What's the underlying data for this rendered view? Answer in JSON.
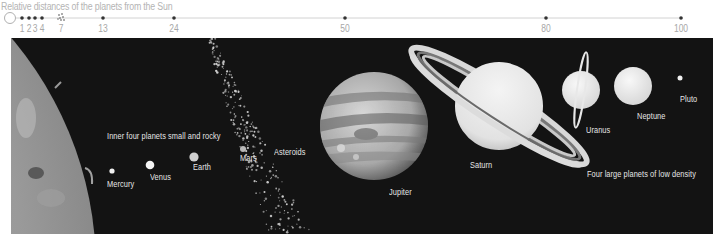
{
  "title": "Relative distances of the planets from the Sun",
  "scale": {
    "ticks": [
      {
        "value": "1",
        "x": 22
      },
      {
        "value": "2",
        "x": 29
      },
      {
        "value": "3",
        "x": 35
      },
      {
        "value": "4",
        "x": 42
      },
      {
        "value": "7",
        "x": 61
      },
      {
        "value": "13",
        "x": 103
      },
      {
        "value": "24",
        "x": 174
      },
      {
        "value": "50",
        "x": 345
      },
      {
        "value": "80",
        "x": 546
      },
      {
        "value": "100",
        "x": 681
      }
    ]
  },
  "captions": {
    "inner": "Inner four planets small and rocky",
    "outer": "Four large planets of low density"
  },
  "bodies": {
    "mercury": "Mercury",
    "venus": "Venus",
    "earth": "Earth",
    "mars": "Mars",
    "asteroids": "Asteroids",
    "jupiter": "Jupiter",
    "saturn": "Saturn",
    "uranus": "Uranus",
    "neptune": "Neptune",
    "pluto": "Pluto"
  },
  "colors": {
    "background": "#131313",
    "scale_line": "#cfcfcf",
    "scale_label": "#a8a8a8",
    "label": "#e6e6e6"
  }
}
